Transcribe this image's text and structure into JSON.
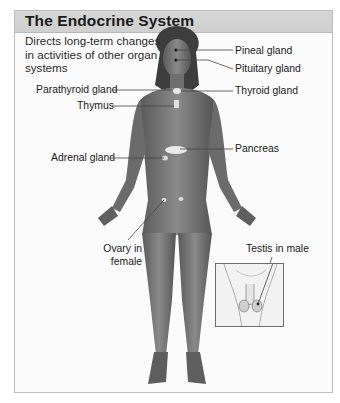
{
  "header": {
    "title": "The Endocrine System"
  },
  "description": "Directs long-term changes in activities of other organ systems",
  "labels": {
    "pineal": "Pineal gland",
    "pituitary": "Pituitary gland",
    "parathyroid": "Parathyroid gland",
    "thyroid": "Thyroid gland",
    "thymus": "Thymus",
    "pancreas": "Pancreas",
    "adrenal": "Adrenal gland",
    "ovary_line1": "Ovary in",
    "ovary_line2": "female",
    "testis": "Testis in male"
  },
  "colors": {
    "header_bg": "#d3d3d3",
    "panel_border": "#bdbdbd",
    "body_tone": "#7a7a7a",
    "gland": "#e9e9e9"
  }
}
